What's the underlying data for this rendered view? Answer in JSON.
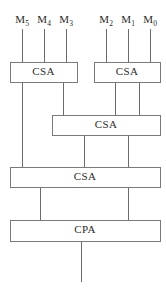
{
  "diagram": {
    "canvas": {
      "width": 166,
      "height": 288
    },
    "colors": {
      "background": "#ffffff",
      "wire": "#6b6b6b",
      "box_border": "#7a7a7a",
      "box_fill": "#ffffff",
      "text": "#2c2c2c"
    },
    "input_labels": [
      {
        "id": "m5",
        "base": "M",
        "sub": "5",
        "text": "M5",
        "x": 22,
        "y": 14
      },
      {
        "id": "m4",
        "base": "M",
        "sub": "4",
        "text": "M4",
        "x": 44,
        "y": 14
      },
      {
        "id": "m3",
        "base": "M",
        "sub": "3",
        "text": "M3",
        "x": 66,
        "y": 14
      },
      {
        "id": "m2",
        "base": "M",
        "sub": "2",
        "text": "M2",
        "x": 106,
        "y": 14
      },
      {
        "id": "m1",
        "base": "M",
        "sub": "1",
        "text": "M1",
        "x": 128,
        "y": 14
      },
      {
        "id": "m0",
        "base": "M",
        "sub": "0",
        "text": "M0",
        "x": 150,
        "y": 14
      }
    ],
    "boxes": [
      {
        "id": "csa-1",
        "label": "CSA",
        "x": 10,
        "y": 62,
        "w": 67,
        "h": 20,
        "label_x": 43.5,
        "label_y": 72.5
      },
      {
        "id": "csa-2",
        "label": "CSA",
        "x": 94,
        "y": 62,
        "w": 66,
        "h": 20,
        "label_x": 127,
        "label_y": 72.5
      },
      {
        "id": "csa-3",
        "label": "CSA",
        "x": 52,
        "y": 115,
        "w": 108,
        "h": 20,
        "label_x": 106,
        "label_y": 125.5
      },
      {
        "id": "csa-4",
        "label": "CSA",
        "x": 10,
        "y": 167,
        "w": 150,
        "h": 20,
        "label_x": 85,
        "label_y": 177.5
      },
      {
        "id": "cpa-1",
        "label": "CPA",
        "x": 10,
        "y": 220,
        "w": 150,
        "h": 21,
        "label_x": 85,
        "label_y": 230.5
      }
    ],
    "wires": [
      {
        "id": "in-m5",
        "x1": 22,
        "y1": 29,
        "x2": 22,
        "y2": 62
      },
      {
        "id": "in-m4",
        "x1": 44,
        "y1": 29,
        "x2": 44,
        "y2": 62
      },
      {
        "id": "in-m3",
        "x1": 66,
        "y1": 29,
        "x2": 66,
        "y2": 62
      },
      {
        "id": "in-m2",
        "x1": 106,
        "y1": 29,
        "x2": 106,
        "y2": 62
      },
      {
        "id": "in-m1",
        "x1": 128,
        "y1": 29,
        "x2": 128,
        "y2": 62
      },
      {
        "id": "in-m0",
        "x1": 150,
        "y1": 29,
        "x2": 150,
        "y2": 62
      },
      {
        "id": "csa1-out-left",
        "x1": 22,
        "y1": 82,
        "x2": 22,
        "y2": 167
      },
      {
        "id": "csa1-out-right",
        "x1": 63,
        "y1": 82,
        "x2": 63,
        "y2": 115
      },
      {
        "id": "csa2-out-left",
        "x1": 115,
        "y1": 82,
        "x2": 115,
        "y2": 115
      },
      {
        "id": "csa2-out-right",
        "x1": 139,
        "y1": 82,
        "x2": 139,
        "y2": 115
      },
      {
        "id": "csa3-out-left",
        "x1": 84,
        "y1": 135,
        "x2": 84,
        "y2": 167
      },
      {
        "id": "csa3-out-right",
        "x1": 128,
        "y1": 135,
        "x2": 128,
        "y2": 167
      },
      {
        "id": "csa4-out-left",
        "x1": 40,
        "y1": 187,
        "x2": 40,
        "y2": 220
      },
      {
        "id": "csa4-out-right",
        "x1": 128,
        "y1": 187,
        "x2": 128,
        "y2": 220
      },
      {
        "id": "cpa-out",
        "x1": 81,
        "y1": 241,
        "x2": 81,
        "y2": 282
      }
    ]
  }
}
